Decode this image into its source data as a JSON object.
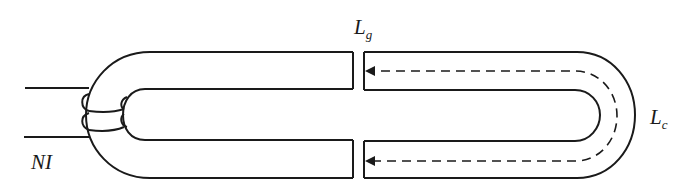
{
  "figure": {
    "labels": {
      "gap": {
        "main": "L",
        "sub": "g"
      },
      "core": {
        "main": "L",
        "sub": "c"
      },
      "winding": "NI"
    },
    "colors": {
      "stroke": "#1a1a1a",
      "background": "#ffffff"
    }
  }
}
